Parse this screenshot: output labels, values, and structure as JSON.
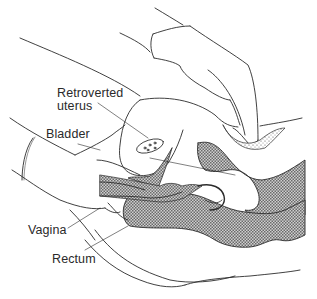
{
  "figure": {
    "type": "anatomical illustration",
    "colors": {
      "line": "#2b2b2b",
      "hatch_fill": "#8a8a8a",
      "background": "#ffffff"
    }
  },
  "labels": {
    "retroverted_uterus_line1": "Retroverted",
    "retroverted_uterus_line2": "uterus",
    "bladder": "Bladder",
    "vagina": "Vagina",
    "rectum": "Rectum"
  }
}
